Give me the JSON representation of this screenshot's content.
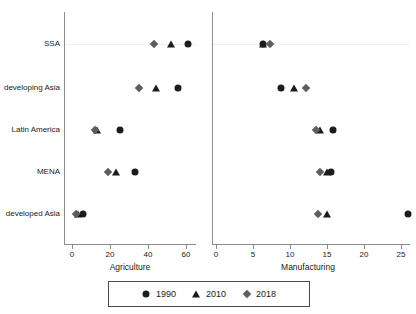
{
  "chart_data": {
    "type": "scatter",
    "title": "",
    "subtitle": "",
    "layout": "two horizontal dot-plot panels sharing categorical y-axis",
    "categories": [
      "SSA",
      "developing Asia",
      "Latin America",
      "MENA",
      "developed Asia"
    ],
    "legend": {
      "position": "bottom-center",
      "boxed": true,
      "entries": [
        {
          "label": "1990",
          "marker": "circle",
          "color": "#1c1c1c"
        },
        {
          "label": "2010",
          "marker": "triangle",
          "color": "#1c1c1c"
        },
        {
          "label": "2018",
          "marker": "diamond",
          "color": "#5e5e5e"
        }
      ]
    },
    "panels": [
      {
        "id": "agriculture",
        "xlabel": "Agriculture",
        "ylabel": "",
        "xlim": [
          -2,
          68
        ],
        "xticks": [
          0,
          20,
          40,
          60
        ],
        "xticklabels": [
          "0",
          "20",
          "40",
          "60"
        ],
        "grid": false,
        "series": [
          {
            "name": "1990",
            "marker": "circle",
            "values": [
              61,
              56,
              25,
              33,
              6
            ]
          },
          {
            "name": "2010",
            "marker": "triangle",
            "values": [
              52,
              44,
              13,
              23,
              3
            ]
          },
          {
            "name": "2018",
            "marker": "diamond",
            "values": [
              43,
              35,
              12,
              19,
              2
            ]
          }
        ]
      },
      {
        "id": "manufacturing",
        "xlabel": "Manufacturing",
        "ylabel": "",
        "xlim": [
          -0.6,
          27
        ],
        "xticks": [
          0,
          5,
          10,
          15,
          20,
          25
        ],
        "xticklabels": [
          "0",
          "5",
          "10",
          "15",
          "20",
          "25"
        ],
        "grid": false,
        "series": [
          {
            "name": "1990",
            "marker": "circle",
            "values": [
              6.3,
              8.8,
              15.8,
              15.6,
              26.0
            ]
          },
          {
            "name": "2010",
            "marker": "triangle",
            "values": [
              6.3,
              10.6,
              14.0,
              15.0,
              15.0
            ]
          },
          {
            "name": "2018",
            "marker": "diamond",
            "values": [
              7.3,
              12.1,
              13.5,
              14.0,
              13.8
            ]
          }
        ]
      }
    ]
  }
}
